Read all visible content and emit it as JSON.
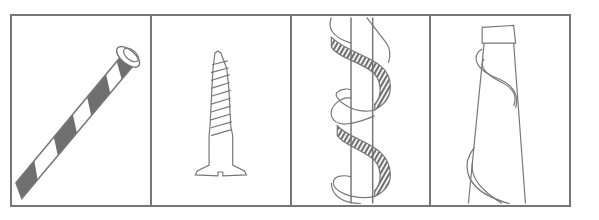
{
  "figure": {
    "panels": [
      {
        "id": "striped-rod",
        "description": "Straight rod with spiral stripe and flared end"
      },
      {
        "id": "wood-screw",
        "description": "Wood screw with threaded shaft and slotted countersunk head"
      },
      {
        "id": "helix-ribbon",
        "description": "Ribbon spiraling around a straight column"
      },
      {
        "id": "cone-spiral",
        "description": "Tapered cone with a band winding around it"
      }
    ],
    "colors": {
      "stroke": "#777777",
      "fill_dark": "#6f6f6f",
      "background": "#ffffff"
    }
  }
}
